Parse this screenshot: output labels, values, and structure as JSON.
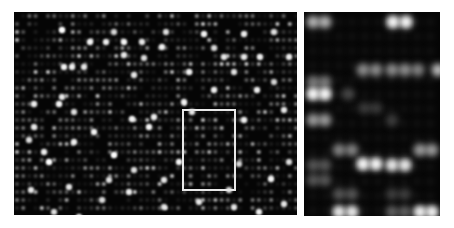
{
  "figure": {
    "background_color": "#ffffff",
    "spot_color": "#ffffff",
    "panel_color": "#050505"
  },
  "left_panel": {
    "x": 14,
    "y": 12,
    "width": 283,
    "height": 203,
    "grid": {
      "pitch_x": 6.2,
      "pitch_y": 8.0,
      "offset_x": 3,
      "offset_y": 4,
      "seed": 17
    },
    "bright_spots": [
      [
        48,
        18,
        1.0
      ],
      [
        76,
        30,
        0.9
      ],
      [
        92,
        30,
        0.85
      ],
      [
        110,
        30,
        0.9
      ],
      [
        128,
        30,
        0.8
      ],
      [
        110,
        43,
        0.8
      ],
      [
        148,
        35,
        0.85
      ],
      [
        130,
        46,
        0.75
      ],
      [
        120,
        63,
        0.8
      ],
      [
        50,
        55,
        0.9
      ],
      [
        58,
        55,
        0.85
      ],
      [
        70,
        55,
        0.8
      ],
      [
        20,
        92,
        0.85
      ],
      [
        45,
        92,
        0.9
      ],
      [
        48,
        85,
        0.8
      ],
      [
        20,
        115,
        0.8
      ],
      [
        60,
        100,
        0.75
      ],
      [
        118,
        107,
        0.9
      ],
      [
        140,
        105,
        0.85
      ],
      [
        80,
        120,
        0.9
      ],
      [
        35,
        150,
        1.0
      ],
      [
        60,
        130,
        0.85
      ],
      [
        100,
        143,
        1.0
      ],
      [
        170,
        90,
        0.85
      ],
      [
        165,
        150,
        0.9
      ],
      [
        135,
        115,
        0.9
      ],
      [
        120,
        158,
        0.75
      ],
      [
        150,
        168,
        0.8
      ],
      [
        190,
        22,
        0.9
      ],
      [
        230,
        22,
        0.85
      ],
      [
        210,
        45,
        0.8
      ],
      [
        230,
        45,
        0.8
      ],
      [
        246,
        45,
        0.85
      ],
      [
        275,
        45,
        0.8
      ],
      [
        175,
        60,
        0.85
      ],
      [
        220,
        60,
        0.7
      ],
      [
        200,
        78,
        0.85
      ],
      [
        243,
        78,
        0.85
      ],
      [
        178,
        100,
        0.8
      ],
      [
        230,
        108,
        0.85
      ],
      [
        270,
        98,
        0.8
      ],
      [
        260,
        70,
        0.7
      ],
      [
        55,
        175,
        0.8
      ],
      [
        65,
        205,
        0.85
      ],
      [
        40,
        200,
        0.75
      ],
      [
        115,
        180,
        0.85
      ],
      [
        150,
        195,
        0.75
      ],
      [
        185,
        190,
        0.8
      ],
      [
        245,
        200,
        0.85
      ],
      [
        270,
        192,
        0.8
      ],
      [
        257,
        167,
        0.9
      ],
      [
        275,
        150,
        0.75
      ],
      [
        225,
        152,
        0.7
      ],
      [
        17,
        178,
        0.8
      ],
      [
        88,
        188,
        0.7
      ],
      [
        200,
        36,
        0.7
      ],
      [
        152,
        20,
        0.7
      ],
      [
        260,
        20,
        0.75
      ],
      [
        100,
        20,
        0.7
      ],
      [
        30,
        140,
        0.85
      ],
      [
        15,
        128,
        0.75
      ],
      [
        95,
        168,
        0.75
      ],
      [
        215,
        178,
        0.75
      ],
      [
        220,
        195,
        0.7
      ]
    ]
  },
  "zoom_box": {
    "x": 182,
    "y": 109,
    "width": 54,
    "height": 82,
    "stroke": "#e8e8e8"
  },
  "right_panel": {
    "x": 304,
    "y": 12,
    "width": 136,
    "height": 204,
    "spots": [
      [
        9,
        10,
        0.7
      ],
      [
        21,
        10,
        0.7
      ],
      [
        89,
        10,
        1.0
      ],
      [
        102,
        10,
        1.0
      ],
      [
        59,
        58,
        0.55
      ],
      [
        72,
        58,
        0.55
      ],
      [
        88,
        58,
        0.55
      ],
      [
        101,
        58,
        0.55
      ],
      [
        114,
        58,
        0.5
      ],
      [
        134,
        58,
        0.75
      ],
      [
        9,
        70,
        0.45
      ],
      [
        21,
        70,
        0.45
      ],
      [
        9,
        82,
        1.0
      ],
      [
        21,
        82,
        1.0
      ],
      [
        44,
        82,
        0.25
      ],
      [
        9,
        108,
        0.6
      ],
      [
        21,
        108,
        0.6
      ],
      [
        88,
        108,
        0.2
      ],
      [
        60,
        96,
        0.18
      ],
      [
        72,
        96,
        0.18
      ],
      [
        35,
        138,
        0.5
      ],
      [
        48,
        138,
        0.5
      ],
      [
        116,
        138,
        0.6
      ],
      [
        128,
        138,
        0.6
      ],
      [
        59,
        152,
        1.0
      ],
      [
        72,
        152,
        1.0
      ],
      [
        88,
        153,
        0.9
      ],
      [
        101,
        153,
        0.9
      ],
      [
        9,
        153,
        0.3
      ],
      [
        21,
        153,
        0.3
      ],
      [
        9,
        168,
        0.3
      ],
      [
        21,
        168,
        0.3
      ],
      [
        35,
        182,
        0.3
      ],
      [
        48,
        182,
        0.3
      ],
      [
        88,
        182,
        0.2
      ],
      [
        101,
        182,
        0.2
      ],
      [
        35,
        200,
        0.9
      ],
      [
        48,
        200,
        0.9
      ],
      [
        88,
        200,
        0.35
      ],
      [
        101,
        200,
        0.35
      ],
      [
        116,
        200,
        0.95
      ],
      [
        128,
        200,
        0.95
      ]
    ]
  }
}
